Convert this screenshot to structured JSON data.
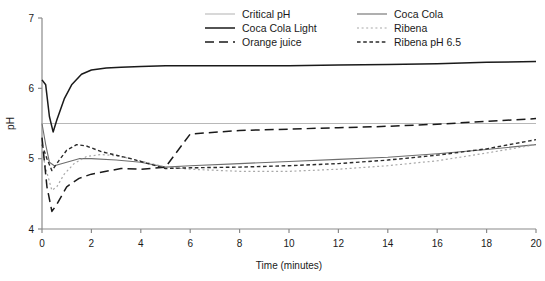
{
  "chart_data": {
    "type": "line",
    "title": "",
    "xlabel": "Time (minutes)",
    "ylabel": "pH",
    "xlim": [
      0,
      20
    ],
    "ylim": [
      4,
      7
    ],
    "xticks": [
      0,
      2,
      4,
      6,
      8,
      10,
      12,
      14,
      16,
      18,
      20
    ],
    "yticks": [
      4,
      5,
      6,
      7
    ],
    "grid": false,
    "legend_position": "top-right",
    "legend_columns": 2,
    "series": [
      {
        "name": "Critical pH",
        "style": "solid",
        "color": "#b8b8b8",
        "width": 1.1,
        "x": [
          0,
          20
        ],
        "values": [
          5.5,
          5.5
        ]
      },
      {
        "name": "Coca Cola",
        "style": "solid",
        "color": "#6e6e6e",
        "width": 1.1,
        "x": [
          0,
          0.15,
          0.3,
          0.5,
          1,
          1.5,
          2,
          3,
          4,
          5,
          6,
          8,
          10,
          12,
          14,
          16,
          18,
          20
        ],
        "values": [
          5.5,
          5.2,
          4.95,
          4.9,
          4.95,
          5.0,
          5.0,
          4.98,
          4.95,
          4.88,
          4.9,
          4.93,
          4.96,
          4.99,
          5.02,
          5.07,
          5.13,
          5.2
        ]
      },
      {
        "name": "Coca Cola Light",
        "style": "solid",
        "color": "#1a1a1a",
        "width": 1.5,
        "x": [
          0,
          0.15,
          0.3,
          0.45,
          0.6,
          0.9,
          1.2,
          1.6,
          2,
          2.6,
          3.2,
          4,
          5,
          6,
          8,
          10,
          12,
          14,
          16,
          18,
          20
        ],
        "values": [
          6.12,
          6.05,
          5.6,
          5.38,
          5.55,
          5.85,
          6.05,
          6.2,
          6.26,
          6.29,
          6.3,
          6.31,
          6.32,
          6.32,
          6.32,
          6.32,
          6.33,
          6.34,
          6.35,
          6.37,
          6.38
        ]
      },
      {
        "name": "Ribena",
        "style": "dotted",
        "color": "#a8a8a8",
        "width": 1.2,
        "x": [
          0,
          0.2,
          0.4,
          0.6,
          0.9,
          1.3,
          1.8,
          2.4,
          3,
          3.6,
          4.2,
          5,
          6,
          8,
          10,
          12,
          14,
          16,
          18,
          20
        ],
        "values": [
          5.1,
          4.8,
          4.55,
          4.6,
          4.78,
          4.93,
          5.03,
          5.06,
          5.04,
          5.0,
          4.95,
          4.88,
          4.85,
          4.82,
          4.82,
          4.85,
          4.9,
          4.97,
          5.08,
          5.2
        ]
      },
      {
        "name": "Orange juice",
        "style": "dashed-long",
        "color": "#1a1a1a",
        "width": 1.5,
        "x": [
          0,
          0.2,
          0.4,
          0.6,
          1,
          1.5,
          2,
          2.6,
          3.2,
          4,
          5,
          6,
          8,
          10,
          12,
          14,
          16,
          18,
          20
        ],
        "values": [
          5.3,
          4.6,
          4.25,
          4.35,
          4.6,
          4.72,
          4.78,
          4.82,
          4.86,
          4.85,
          4.88,
          5.35,
          5.4,
          5.42,
          5.44,
          5.46,
          5.49,
          5.53,
          5.57
        ]
      },
      {
        "name": "Ribena pH 6.5",
        "style": "dashed-short",
        "color": "#2b2b2b",
        "width": 1.4,
        "x": [
          0,
          0.2,
          0.4,
          0.7,
          1,
          1.4,
          1.8,
          2.4,
          3,
          3.6,
          4.2,
          5,
          6,
          8,
          10,
          12,
          14,
          16,
          18,
          20
        ],
        "values": [
          5.2,
          5.0,
          4.83,
          4.98,
          5.12,
          5.2,
          5.18,
          5.1,
          5.05,
          5.0,
          4.94,
          4.86,
          4.87,
          4.88,
          4.9,
          4.93,
          4.98,
          5.05,
          5.14,
          5.27
        ]
      }
    ]
  },
  "legend": {
    "items": [
      {
        "label": "Critical pH",
        "series": "Critical pH"
      },
      {
        "label": "Coca Cola",
        "series": "Coca Cola"
      },
      {
        "label": "Coca Cola Light",
        "series": "Coca Cola Light"
      },
      {
        "label": "Ribena",
        "series": "Ribena"
      },
      {
        "label": "Orange juice",
        "series": "Orange juice"
      },
      {
        "label": "Ribena pH 6.5",
        "series": "Ribena pH 6.5"
      }
    ]
  }
}
